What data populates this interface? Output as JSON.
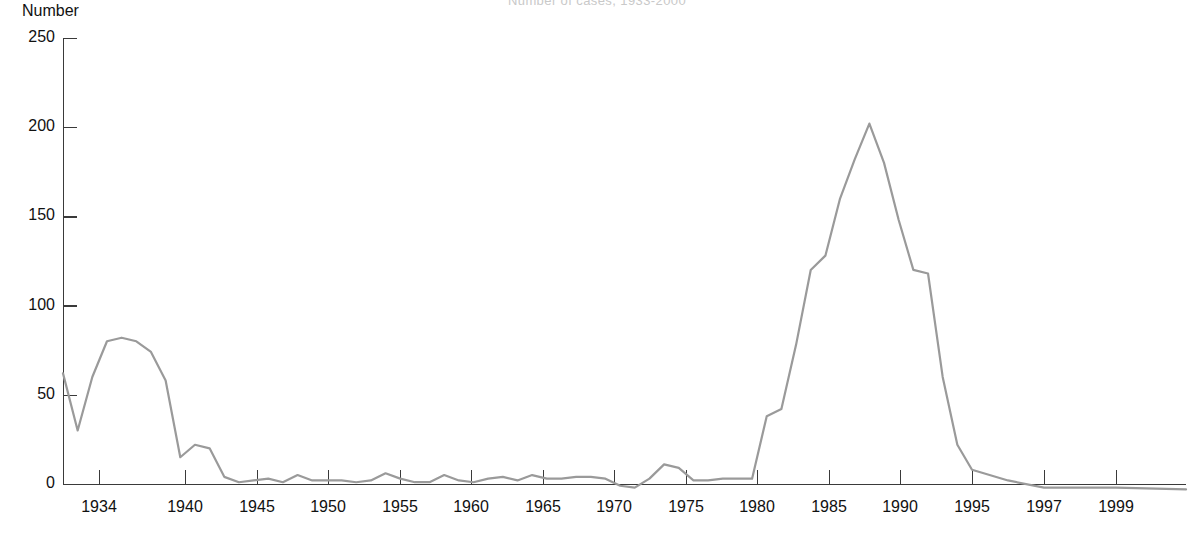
{
  "chart_data": {
    "type": "line",
    "title": "Number of cases, 1933-2000",
    "ylabel": "Number",
    "xlabel": "",
    "ylim": [
      0,
      250
    ],
    "yticks": [
      0,
      50,
      100,
      150,
      200,
      250
    ],
    "ytick_labels": [
      "0",
      "50",
      "100",
      "150",
      "200",
      "250"
    ],
    "xtick_labels": [
      "1934",
      "1940",
      "1945",
      "1950",
      "1955",
      "1960",
      "1965",
      "1970",
      "1975",
      "1980",
      "1985",
      "1990",
      "1995",
      "1997",
      "1999"
    ],
    "xticks": [
      1934,
      1940,
      1945,
      1950,
      1955,
      1960,
      1965,
      1970,
      1975,
      1980,
      1985,
      1990,
      1995,
      1997,
      1999
    ],
    "grid": false,
    "legend": "none",
    "line_color": "#9a9a9a",
    "axis_color": "#3a3a3a",
    "series": [
      {
        "name": "Number",
        "x": [
          1933,
          1934,
          1935,
          1936,
          1937,
          1938,
          1939,
          1940,
          1941,
          1942,
          1943,
          1944,
          1945,
          1946,
          1947,
          1948,
          1949,
          1950,
          1951,
          1952,
          1953,
          1954,
          1955,
          1956,
          1957,
          1958,
          1959,
          1960,
          1961,
          1962,
          1963,
          1964,
          1965,
          1966,
          1967,
          1968,
          1969,
          1970,
          1971,
          1972,
          1973,
          1974,
          1975,
          1976,
          1977,
          1978,
          1979,
          1980,
          1981,
          1982,
          1983,
          1984,
          1985,
          1986,
          1987,
          1988,
          1989,
          1990,
          1991,
          1992,
          1993,
          1994,
          1995,
          1996,
          1997,
          1998,
          1999,
          2000
        ],
        "values": [
          62,
          30,
          60,
          80,
          82,
          80,
          74,
          58,
          15,
          22,
          20,
          4,
          1,
          2,
          3,
          1,
          5,
          2,
          2,
          2,
          1,
          2,
          6,
          3,
          1,
          1,
          5,
          2,
          1,
          3,
          4,
          2,
          5,
          3,
          3,
          4,
          4,
          3,
          -1,
          -2,
          3,
          11,
          9,
          2,
          2,
          3,
          3,
          3,
          38,
          42,
          78,
          120,
          128,
          160,
          182,
          202,
          180,
          148,
          120,
          118,
          60,
          22,
          8,
          2,
          -2,
          -2,
          -2,
          -3
        ]
      }
    ]
  },
  "axis_geometry": {
    "plot_left": 63,
    "plot_right": 1186,
    "plot_top": 38,
    "plot_bottom": 484,
    "x_tick_px": [
      99,
      185,
      257,
      328,
      400,
      471,
      543,
      614,
      686,
      757,
      829,
      900,
      972,
      1044,
      1116
    ],
    "x_domain_px": [
      {
        "year": 1933,
        "px": 63
      },
      {
        "year": 1995,
        "px": 972
      },
      {
        "year": 1997,
        "px": 1044
      },
      {
        "year": 1999,
        "px": 1116
      },
      {
        "year": 2000,
        "px": 1186
      }
    ]
  }
}
